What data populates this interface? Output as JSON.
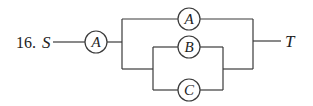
{
  "problem_number": "16.",
  "source_terminal": "S",
  "target_terminal": "T",
  "components": {
    "series_a": "A",
    "parallel_top_a": "A",
    "inner_b": "B",
    "inner_c": "C"
  },
  "colors": {
    "line": "#3a3a3a",
    "text": "#222222",
    "background": "#ffffff"
  },
  "structure": "S — A — [ A || ( B || C ) ] — T"
}
